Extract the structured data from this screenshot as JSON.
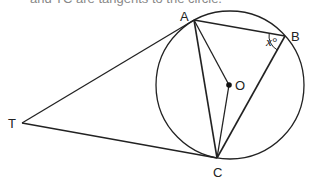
{
  "caption": "and TC are tangents to the circle.",
  "diagram": {
    "points": {
      "T": {
        "label": "T",
        "x": 22,
        "y": 123
      },
      "A": {
        "label": "A",
        "x": 194,
        "y": 20
      },
      "B": {
        "label": "B",
        "x": 285,
        "y": 36
      },
      "C": {
        "label": "C",
        "x": 217,
        "y": 158
      },
      "O": {
        "label": "O",
        "x": 229,
        "y": 85
      }
    },
    "circle": {
      "cx": 230,
      "cy": 85,
      "r": 74
    },
    "angle_label": "x°",
    "stroke_color": "#222222"
  }
}
